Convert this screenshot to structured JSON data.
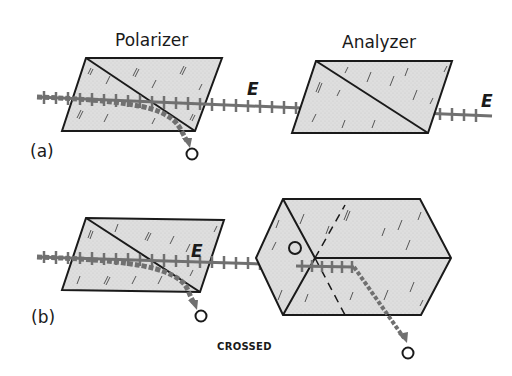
{
  "figure": {
    "panel_a": {
      "label": "(a)",
      "polarizer_title": "Polarizer",
      "analyzer_title": "Analyzer",
      "e_label_middle": "E",
      "e_label_right": "E",
      "o_ray_label": "O"
    },
    "panel_b": {
      "label": "(b)",
      "e_label": "E",
      "o_ray_label_polarizer": "O",
      "o_ray_label_inside_analyzer": "O",
      "o_ray_label_exit": "O",
      "caption": "CROSSED"
    },
    "colors": {
      "prism_fill": "#dcdcdc",
      "outline": "#1a1a1a",
      "ray": "#707070",
      "background": "#ffffff"
    }
  }
}
